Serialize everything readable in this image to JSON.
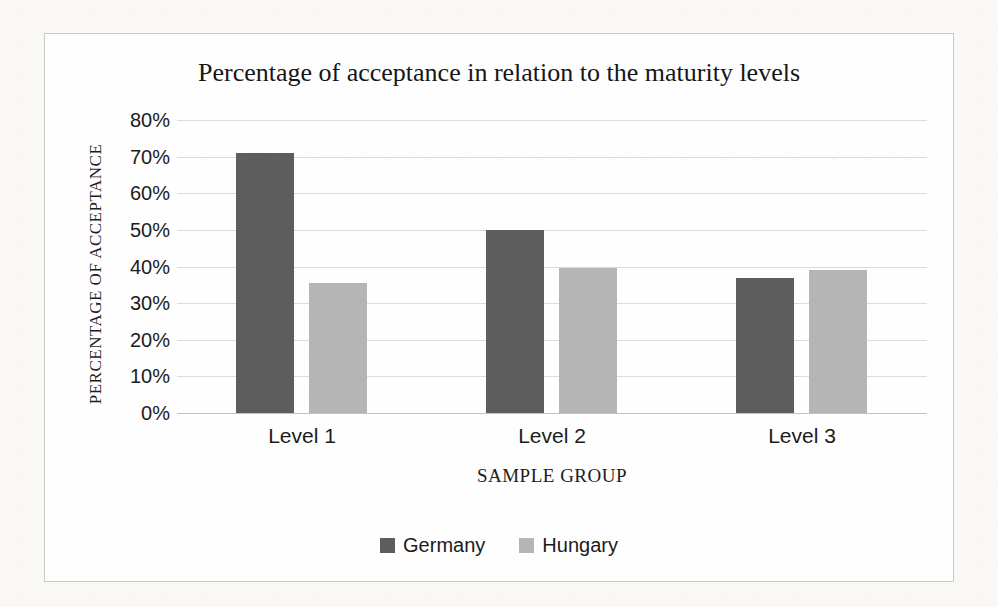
{
  "chart_data": {
    "type": "bar",
    "title": "Percentage of acceptance in relation to the maturity levels",
    "xlabel": "SAMPLE GROUP",
    "ylabel": "PERCENTAGE OF ACCEPTANCE",
    "categories": [
      "Level 1",
      "Level 2",
      "Level 3"
    ],
    "series": [
      {
        "name": "Germany",
        "color": "#5d5d5d",
        "values": [
          71,
          50,
          37
        ]
      },
      {
        "name": "Hungary",
        "color": "#b5b5b5",
        "values": [
          35.5,
          39.5,
          39
        ]
      }
    ],
    "ylim": [
      0,
      80
    ],
    "ytick_step": 10,
    "ytick_format": "percent",
    "grid": true,
    "legend_position": "bottom"
  }
}
